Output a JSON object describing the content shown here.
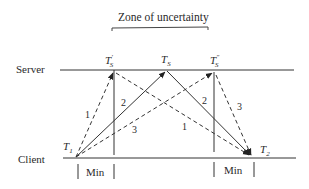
{
  "title": "Zone of uncertainty",
  "rows": {
    "server": "Server",
    "client": "Client"
  },
  "server_times": {
    "left": {
      "base": "T",
      "sub": "S",
      "prime": "′"
    },
    "middle": {
      "base": "T",
      "sub": "S",
      "prime": ""
    },
    "right": {
      "base": "T",
      "sub": "S",
      "prime": "″"
    }
  },
  "client_times": {
    "start": {
      "base": "T",
      "sub": "1"
    },
    "end": {
      "base": "T",
      "sub": "2"
    }
  },
  "message_labels": {
    "out_1": "1",
    "out_2": "2",
    "out_3": "3",
    "ret_1": "1",
    "ret_2": "2",
    "ret_3": "3"
  },
  "min_labels": {
    "left": "Min",
    "right": "Min"
  },
  "colors": {
    "line": "#333333",
    "text": "#2a2a2a"
  }
}
